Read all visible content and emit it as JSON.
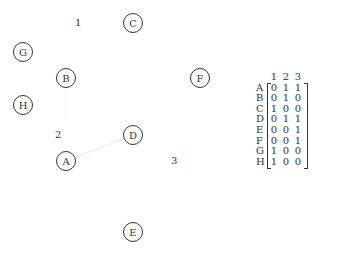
{
  "hypergraph": {
    "nodes": [
      {
        "id": "A",
        "x": 66,
        "y": 161
      },
      {
        "id": "B",
        "x": 66,
        "y": 78
      },
      {
        "id": "C",
        "x": 133,
        "y": 23
      },
      {
        "id": "D",
        "x": 133,
        "y": 135
      },
      {
        "id": "E",
        "x": 133,
        "y": 232
      },
      {
        "id": "F",
        "x": 200,
        "y": 78
      },
      {
        "id": "G",
        "x": 23,
        "y": 52
      },
      {
        "id": "H",
        "x": 23,
        "y": 105
      }
    ],
    "hyperedge_labels": [
      {
        "label": "1",
        "x": 78,
        "y": 23
      },
      {
        "label": "2",
        "x": 58,
        "y": 135
      },
      {
        "label": "3",
        "x": 174,
        "y": 161
      }
    ],
    "edges": [
      {
        "from": "A",
        "to": "D",
        "color": "#e6e6e6"
      }
    ]
  },
  "incidence_matrix": {
    "columns": [
      "1",
      "2",
      "3"
    ],
    "rows": [
      {
        "label": "A",
        "values": [
          "0",
          "1",
          "1"
        ]
      },
      {
        "label": "B",
        "values": [
          "0",
          "1",
          "0"
        ]
      },
      {
        "label": "C",
        "values": [
          "1",
          "0",
          "0"
        ]
      },
      {
        "label": "D",
        "values": [
          "0",
          "1",
          "1"
        ]
      },
      {
        "label": "E",
        "values": [
          "0",
          "0",
          "1"
        ]
      },
      {
        "label": "F",
        "values": [
          "0",
          "0",
          "1"
        ]
      },
      {
        "label": "G",
        "values": [
          "1",
          "0",
          "0"
        ]
      },
      {
        "label": "H",
        "values": [
          "1",
          "0",
          "0"
        ]
      }
    ]
  }
}
